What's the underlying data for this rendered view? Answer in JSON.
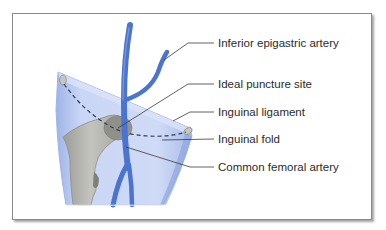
{
  "figure": {
    "type": "anatomical-diagram"
  },
  "labels": [
    {
      "id": "inferior-epigastric-artery",
      "text": "Inferior epigastric artery",
      "x": 218,
      "y": 36
    },
    {
      "id": "ideal-puncture-site",
      "text": "Ideal puncture site",
      "x": 218,
      "y": 78
    },
    {
      "id": "inguinal-ligament",
      "text": "Inguinal ligament",
      "x": 218,
      "y": 106
    },
    {
      "id": "inguinal-fold",
      "text": "Inguinal fold",
      "x": 218,
      "y": 133
    },
    {
      "id": "common-femoral-artery",
      "text": "Common femoral artery",
      "x": 218,
      "y": 162
    }
  ],
  "colors": {
    "artery": "#4a74d0",
    "artery_dark": "#2f58b8",
    "skin": "#c5d3f3",
    "skin_edge": "#9fb4e6",
    "bone": "#b9b9b4",
    "bone_shadow": "#8e8e88",
    "leader": "#3a3a3a",
    "frame": "#8a8a8a"
  }
}
